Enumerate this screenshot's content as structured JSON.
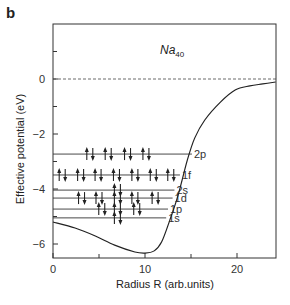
{
  "panel_label": "b",
  "chart_data": {
    "type": "line",
    "title": "",
    "annotation": {
      "base": "Na",
      "subscript": "40"
    },
    "xlabel": "Radius R (arb.units)",
    "ylabel": "Effective potential (eV)",
    "xlim": [
      0,
      24.2
    ],
    "ylim": [
      -6.5,
      2
    ],
    "xticks": [
      0,
      10,
      20
    ],
    "xminor_ticks": [
      5,
      15
    ],
    "yticks": [
      0,
      -2,
      -4,
      -6
    ],
    "yminor_ticks": [
      1,
      -1,
      -3,
      -5
    ],
    "grid": false,
    "reference_line": {
      "y": 0,
      "style": "dashed"
    },
    "series": [
      {
        "name": "Effective potential",
        "x": [
          0,
          2.4,
          4.6,
          6.7,
          8.9,
          10.0,
          11.0,
          11.8,
          12.7,
          13.6,
          14.6,
          15.4,
          16.5,
          18.2,
          19.8,
          21.4,
          22.8,
          24.2
        ],
        "y": [
          -5.2,
          -5.42,
          -5.71,
          -6.04,
          -6.29,
          -6.33,
          -6.25,
          -5.93,
          -5.13,
          -4.22,
          -2.95,
          -2.15,
          -1.49,
          -0.84,
          -0.4,
          -0.25,
          -0.18,
          -0.11
        ]
      }
    ],
    "levels": [
      {
        "label": "2p",
        "energy": -2.73,
        "x_end": 15.1,
        "electron_pairs_x": [
          4.0,
          6.0,
          8.1,
          10.1
        ]
      },
      {
        "label": "1f",
        "energy": -3.49,
        "x_end": 13.8,
        "electron_pairs_x": [
          1.0,
          3.0,
          4.9,
          6.9,
          8.9,
          10.9,
          12.8
        ]
      },
      {
        "label": "2s",
        "energy": -4.04,
        "x_end": 13.2,
        "electron_pairs_x": [
          7.0
        ]
      },
      {
        "label": "1d",
        "energy": -4.33,
        "x_end": 13.0,
        "electron_pairs_x": [
          3.1,
          5.0,
          7.0,
          8.9,
          11.1
        ]
      },
      {
        "label": "1p",
        "energy": -4.73,
        "x_end": 12.5,
        "electron_pairs_x": [
          5.3,
          7.0,
          9.1
        ]
      },
      {
        "label": "1s",
        "energy": -5.05,
        "x_end": 12.3,
        "electron_pairs_x": [
          7.0
        ]
      }
    ]
  }
}
